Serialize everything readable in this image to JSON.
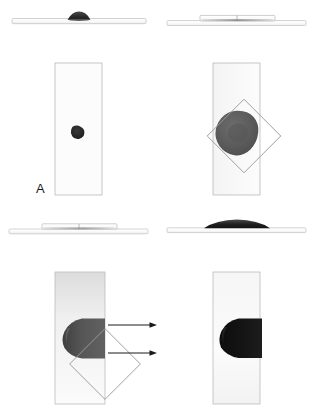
{
  "figure": {
    "background_color": "#ffffff",
    "width": 316,
    "height": 415,
    "panel_count": 4
  },
  "colors": {
    "substrate_fill": "#fbfbfb",
    "substrate_stroke": "#b4b4b4",
    "droplet_small_dark": "#2b2b2b",
    "droplet_mid_gray": "#5e5e5e",
    "droplet_dark_gray": "#4a4a4a",
    "droplet_black": "#111111",
    "overlay_square_stroke": "#9a9a9a",
    "arrow_color": "#1a1a1a",
    "label_color": "#1a1a1a",
    "side_bar_fill": "#fdfdfd",
    "side_bar_stroke": "#bdbdbd"
  },
  "panels": [
    {
      "id": "A",
      "label": "A",
      "side_view": {
        "description": "thin horizontal substrate bar with small dark droplet bump at center",
        "bar_count": 1,
        "droplet_state": "compact-bead",
        "droplet_width": 22,
        "droplet_height": 7
      },
      "top_view": {
        "description": "vertical rectangular substrate with a small dark droplet near the center",
        "droplet_state": "small-round-blob",
        "droplet_center_x": 78,
        "droplet_center_y": 132,
        "droplet_size": 13,
        "overlay_square": false,
        "arrows": 0,
        "gradient": false
      }
    },
    {
      "id": "B",
      "label": "B",
      "side_view": {
        "description": "two overlapping horizontal bars, a shorter upper bar over a longer lower bar with flattened droplet between",
        "bar_count": 2,
        "droplet_state": "flattened-film",
        "droplet_width": 60,
        "droplet_height": 3
      },
      "top_view": {
        "description": "vertical rectangular substrate with a large spread droplet and a rotated square (diamond) outline overlay",
        "droplet_state": "large-irregular-blob",
        "droplet_center_x": 78,
        "droplet_center_y": 133,
        "droplet_size": 46,
        "overlay_square": true,
        "overlay_square_center_x": 86,
        "overlay_square_center_y": 136,
        "overlay_square_size": 52,
        "overlay_square_rotation_deg": 45,
        "arrows": 0,
        "gradient": false
      }
    },
    {
      "id": "C",
      "label": "C",
      "side_view": {
        "description": "two overlapping horizontal bars with a thin elongated gray film layer",
        "bar_count": 2,
        "droplet_state": "thin-spread-film",
        "droplet_width": 62,
        "droplet_height": 3
      },
      "top_view": {
        "description": "vertical rectangular substrate with a gray rounded-nose droplet reaching the right edge, rotated square outline at the edge, and two rightward arrows indicating motion",
        "droplet_state": "advancing-nose",
        "droplet_nose_x": 63,
        "droplet_center_y": 330,
        "droplet_length": 45,
        "droplet_height": 40,
        "overlay_square": true,
        "overlay_square_center_x": 105,
        "overlay_square_center_y": 331,
        "overlay_square_size": 50,
        "overlay_square_rotation_deg": 45,
        "arrows": 2,
        "arrow_direction": "right",
        "gradient": true
      }
    },
    {
      "id": "D",
      "label": "D",
      "side_view": {
        "description": "single horizontal bar with a broad flattened black droplet lens on top",
        "bar_count": 1,
        "droplet_state": "broad-flat-lens",
        "droplet_width": 66,
        "droplet_height": 8
      },
      "top_view": {
        "description": "vertical rectangular substrate with a black rounded-nose droplet occupying the right portion, no overlay or arrows",
        "droplet_state": "advancing-nose-black",
        "droplet_nose_x": 218,
        "droplet_center_y": 330,
        "droplet_length": 46,
        "droplet_height": 40,
        "overlay_square": false,
        "arrows": 0,
        "gradient": true
      }
    }
  ]
}
